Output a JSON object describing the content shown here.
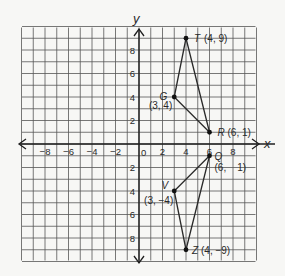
{
  "figure": {
    "type": "coordinate-plane",
    "x_axis_label": "x",
    "y_axis_label": "y",
    "origin_label": "0",
    "x_tick_labels": [
      "−8",
      "−6",
      "−4",
      "−2",
      "2",
      "4",
      "6",
      "8"
    ],
    "x_tick_values": [
      -8,
      -6,
      -4,
      -2,
      2,
      4,
      6,
      8
    ],
    "y_tick_labels_pos": [
      "2",
      "4",
      "6",
      "8"
    ],
    "y_tick_values_pos": [
      2,
      4,
      6,
      8
    ],
    "y_tick_labels_neg": [
      "2",
      "4",
      "6",
      "8"
    ],
    "y_tick_values_neg": [
      -2,
      -4,
      -6,
      -8
    ],
    "grid_range": {
      "xmin": -10,
      "xmax": 10,
      "ymin": -10,
      "ymax": 10
    },
    "colors": {
      "grid": "#555555",
      "axis": "#1f1f1f",
      "background": "#f7f7f5",
      "line": "#2a2a2a"
    }
  },
  "triangles": [
    {
      "name": "TGR",
      "vertices": [
        {
          "name": "T",
          "x": 4,
          "y": 9,
          "label": "T",
          "coord_label": "(4, 9)"
        },
        {
          "name": "G",
          "x": 3,
          "y": 4,
          "label": "G",
          "coord_label": "(3, 4)"
        },
        {
          "name": "R",
          "x": 6,
          "y": 1,
          "label": "R",
          "coord_label": "(6, 1)"
        }
      ]
    },
    {
      "name": "QVZ",
      "vertices": [
        {
          "name": "Q",
          "x": 6,
          "y": -1,
          "label": "Q",
          "coord_label": "(6,    1)"
        },
        {
          "name": "V",
          "x": 3,
          "y": -4,
          "label": "V",
          "coord_label": "(3, −4)"
        },
        {
          "name": "Z",
          "x": 4,
          "y": -9,
          "label": "Z",
          "coord_label": "(4, −9)"
        }
      ]
    }
  ]
}
